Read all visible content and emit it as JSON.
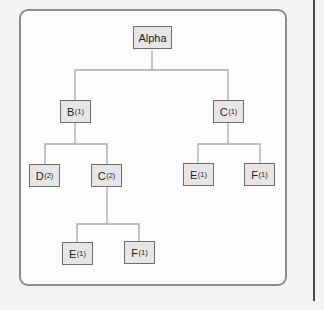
{
  "diagram": {
    "type": "tree",
    "nodes": [
      {
        "id": "alpha",
        "label": "Alpha",
        "sub": "",
        "x": 133,
        "y": 26,
        "w": 39
      },
      {
        "id": "b1",
        "label": "B",
        "sub": "(1)",
        "x": 60,
        "y": 100,
        "w": 31
      },
      {
        "id": "c1",
        "label": "C",
        "sub": "(1)",
        "x": 213,
        "y": 100,
        "w": 31
      },
      {
        "id": "d2",
        "label": "D",
        "sub": "(2)",
        "x": 29,
        "y": 164,
        "w": 31
      },
      {
        "id": "c2",
        "label": "C",
        "sub": "(2)",
        "x": 91,
        "y": 164,
        "w": 31
      },
      {
        "id": "e1r",
        "label": "E",
        "sub": "(1)",
        "x": 183,
        "y": 163,
        "w": 31
      },
      {
        "id": "f1r",
        "label": "F",
        "sub": "(1)",
        "x": 244,
        "y": 163,
        "w": 31
      },
      {
        "id": "e1b",
        "label": "E",
        "sub": "(1)",
        "x": 62,
        "y": 242,
        "w": 31
      },
      {
        "id": "f1b",
        "label": "F",
        "sub": "(1)",
        "x": 124,
        "y": 241,
        "w": 31
      }
    ],
    "edges": [
      [
        "alpha",
        "b1"
      ],
      [
        "alpha",
        "c1"
      ],
      [
        "b1",
        "d2"
      ],
      [
        "b1",
        "c2"
      ],
      [
        "c1",
        "e1r"
      ],
      [
        "c1",
        "f1r"
      ],
      [
        "c2",
        "e1b"
      ],
      [
        "c2",
        "f1b"
      ]
    ],
    "line_color": "#a9a9a9"
  }
}
